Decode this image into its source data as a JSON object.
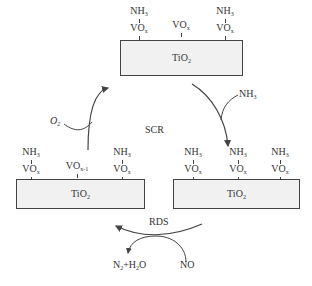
{
  "diagram": {
    "center_label": "SCR",
    "support_label": "TiO",
    "support_sub": "2",
    "top_state": {
      "sites": [
        {
          "adsorbate": "NH",
          "adsorbate_sub": "3",
          "site": "VO",
          "site_sub": "x"
        },
        {
          "adsorbate": "",
          "adsorbate_sub": "",
          "site": "VO",
          "site_sub": "x"
        },
        {
          "adsorbate": "NH",
          "adsorbate_sub": "3",
          "site": "VO",
          "site_sub": "x"
        }
      ]
    },
    "left_state": {
      "sites": [
        {
          "adsorbate": "NH",
          "adsorbate_sub": "3",
          "site": "VO",
          "site_sub": "x"
        },
        {
          "adsorbate": "",
          "adsorbate_sub": "",
          "site": "VO",
          "site_sub": "x-1"
        },
        {
          "adsorbate": "NH",
          "adsorbate_sub": "3",
          "site": "VO",
          "site_sub": "x"
        }
      ]
    },
    "right_state": {
      "sites": [
        {
          "adsorbate": "NH",
          "adsorbate_sub": "3",
          "site": "VO",
          "site_sub": "x"
        },
        {
          "adsorbate": "NH",
          "adsorbate_sub": "3",
          "site": "VO",
          "site_sub": "x"
        },
        {
          "adsorbate": "NH",
          "adsorbate_sub": "3",
          "site": "VO",
          "site_sub": "x"
        }
      ]
    },
    "reactants": {
      "o2": "O",
      "o2_sub": "2",
      "nh3": "NH",
      "nh3_sub": "3",
      "no": "NO"
    },
    "products": {
      "n2": "N",
      "n2_sub": "2",
      "plus": "+H",
      "h2o_sub": "2",
      "h2o_tail": "O"
    },
    "rds_label": "RDS",
    "colors": {
      "box_fill": "#f1f1f1",
      "stroke": "#444444",
      "text": "#333333"
    }
  }
}
